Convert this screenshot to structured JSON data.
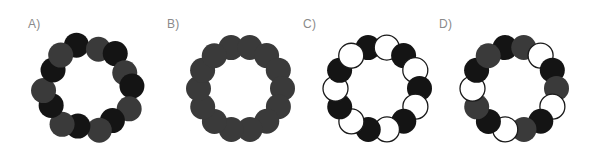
{
  "figure": {
    "width": 598,
    "height": 159,
    "background": "#ffffff"
  },
  "palette": {
    "black": "#141414",
    "gray": "#3a3a3a",
    "white_fill": "#ffffff",
    "white_stroke": "#1a1a1a",
    "label_color": "#8a8a8a",
    "background": "#ffffff"
  },
  "panels": [
    {
      "id": "A",
      "label": "A)",
      "label_x": 28,
      "label_y": 17,
      "ring_cx": 88,
      "ring_cy": 88,
      "ring_radius": 42,
      "node_radius": 12.5,
      "count": 14,
      "start_angle": -103,
      "jitter": true,
      "pattern_name": "alternating-black-gray-irregular",
      "colors": [
        "black",
        "gray",
        "black",
        "gray",
        "black",
        "gray",
        "black",
        "gray",
        "black",
        "gray",
        "black",
        "gray",
        "black",
        "gray"
      ],
      "jitter_r": [
        3.0,
        -1.5,
        2.0,
        -2.5,
        1.5,
        3.5,
        -2.0,
        1.0,
        -3.0,
        2.5,
        -1.0,
        3.0,
        -2.0,
        1.5
      ],
      "jitter_a": [
        -2.5,
        1.5,
        -1.0,
        2.5,
        -3.0,
        1.0,
        2.0,
        -1.5,
        3.0,
        -2.0,
        1.5,
        -2.5,
        2.0,
        -1.0
      ]
    },
    {
      "id": "B",
      "label": "B)",
      "label_x": 167,
      "label_y": 17,
      "ring_cx": 240,
      "ring_cy": 88,
      "ring_radius": 42,
      "node_radius": 12.5,
      "count": 14,
      "start_angle": -103,
      "jitter": false,
      "pattern_name": "uniform-gray",
      "colors": [
        "gray",
        "gray",
        "gray",
        "gray",
        "gray",
        "gray",
        "gray",
        "gray",
        "gray",
        "gray",
        "gray",
        "gray",
        "gray",
        "gray"
      ]
    },
    {
      "id": "C",
      "label": "C)",
      "label_x": 303,
      "label_y": 17,
      "ring_cx": 377,
      "ring_cy": 88,
      "ring_radius": 42,
      "node_radius": 12.5,
      "count": 14,
      "start_angle": -103,
      "jitter": false,
      "pattern_name": "alternating-black-white",
      "colors": [
        "black",
        "white",
        "black",
        "white",
        "black",
        "white",
        "black",
        "white",
        "black",
        "white",
        "black",
        "white",
        "black",
        "white"
      ]
    },
    {
      "id": "D",
      "label": "D)",
      "label_x": 439,
      "label_y": 17,
      "ring_cx": 514,
      "ring_cy": 88,
      "ring_radius": 42,
      "node_radius": 12.5,
      "count": 14,
      "start_angle": -103,
      "jitter": false,
      "pattern_name": "three-cycle-black-gray-white",
      "colors": [
        "black",
        "gray",
        "white",
        "black",
        "gray",
        "white",
        "black",
        "gray",
        "white",
        "black",
        "gray",
        "white",
        "black",
        "gray"
      ]
    }
  ]
}
